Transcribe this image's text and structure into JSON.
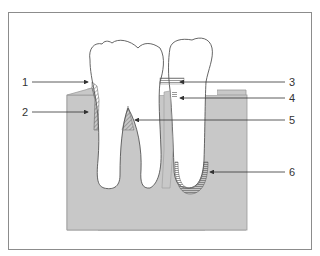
{
  "figure": {
    "colors": {
      "frame": "#8c8c8c",
      "bone": "#c8c8c8",
      "bone_edge": "#9a9a9a",
      "tooth_fill": "#ffffff",
      "tooth_stroke": "#555555",
      "arrow": "#333333",
      "text": "#333333"
    },
    "labels": [
      {
        "id": "1",
        "text": "1",
        "x": 22,
        "y": 77
      },
      {
        "id": "2",
        "text": "2",
        "x": 22,
        "y": 108
      },
      {
        "id": "3",
        "text": "3",
        "x": 289,
        "y": 77
      },
      {
        "id": "4",
        "text": "4",
        "x": 289,
        "y": 95
      },
      {
        "id": "5",
        "text": "5",
        "x": 289,
        "y": 115
      },
      {
        "id": "6",
        "text": "6",
        "x": 289,
        "y": 168
      }
    ]
  }
}
